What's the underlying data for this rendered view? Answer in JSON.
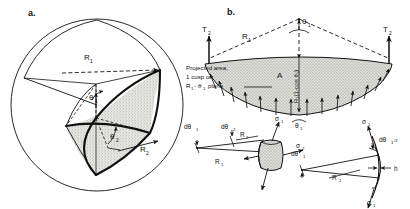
{
  "figure": {
    "background": "#ffffff",
    "ink": "#111111",
    "shade": "#d8d8d4"
  },
  "panel_a": {
    "letter": "a.",
    "description": "Sphere with a shaded curved-triangular cusped patch; radii R1 and R2 with subtended half-angles theta1 and theta2.",
    "labels": {
      "R1": "R",
      "R1_sub": "1",
      "R2": "R",
      "R2_sub": "2",
      "theta1": "θ",
      "theta1_sub": "1",
      "theta2": "θ",
      "theta2_sub": "2"
    }
  },
  "panel_b": {
    "letter": "b.",
    "description": "Projected cusped cap section showing tension T2 at both rims, apex angle theta1, internal pressure arrows, sagitta R1(1-cos theta1), enclosed area A.",
    "labels": {
      "T2_left": "T",
      "T2_left_sub": "2",
      "T2_right": "T",
      "T2_right_sub": "2",
      "R1": "R",
      "R1_sub": "1",
      "theta1_apex": "θ",
      "theta1_apex_sub": "1",
      "theta1_bottom": "θ",
      "theta1_bottom_sub": "1",
      "area": "A",
      "sagitta": "R₁(1-cos θ₁)"
    },
    "callout": {
      "line1": "Projected area,",
      "line2": "1 cusp on",
      "line3_prefix": "R",
      "line3_sub1": "1",
      "line3_dash": "-",
      "line3_theta": "θ",
      "line3_sub2": "1",
      "line3_suffix": "plane"
    }
  },
  "panel_c": {
    "description": "Doubly-curved shell element with principal radii R1, R2, angular increments dtheta1, dtheta2 and membrane stresses sigma1, sigma2.",
    "labels": {
      "dtheta1": "dθ",
      "dtheta1_sub": "1",
      "dtheta2": "dθ",
      "dtheta2_sub": "2",
      "R1": "R",
      "R1_sub": "1",
      "R2": "R",
      "R2_sub": "2",
      "sigma1": "σ",
      "sigma1_sub": "1",
      "sigma2": "σ",
      "sigma2_sub": "2"
    }
  },
  "panel_d": {
    "description": "Edge-on view of a shell strip of thickness h subtending dtheta1 at radius R1, with sigma1 acting on both ends and half-angle dtheta1/2.",
    "labels": {
      "dtheta1": "dθ",
      "dtheta1_sub": "1",
      "dtheta1_half": "dθ",
      "dtheta1_half_sub": "1",
      "dtheta1_half_suffix": "/2",
      "R1": "R",
      "R1_sub": "1",
      "h": "h",
      "sigma1_top": "σ",
      "sigma1_top_sub": "1",
      "sigma1_bottom": "σ",
      "sigma1_bottom_sub": "1"
    }
  }
}
